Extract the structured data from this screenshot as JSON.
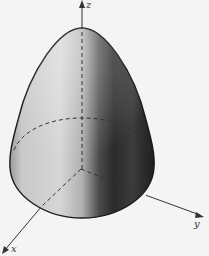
{
  "figure": {
    "axes": {
      "z": {
        "label": "z"
      },
      "y": {
        "label": "y"
      },
      "x": {
        "label": "x"
      }
    },
    "colors": {
      "background": "#f4f4f4",
      "outline": "#1a1a1a",
      "surface_light": "#d8d8d8",
      "surface_dark": "#2e2e2e",
      "axis": "#333333"
    }
  }
}
